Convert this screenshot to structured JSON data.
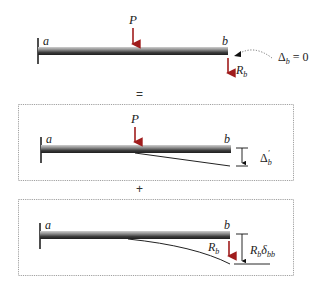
{
  "figure": {
    "colors": {
      "load_arrow": "#a01c1c",
      "beam_dark": "#2a2a2a",
      "beam_light": "#9a9a9a",
      "frame": "#888888",
      "text": "#222222"
    }
  },
  "panel_original": {
    "support_label": "a",
    "end_label": "b",
    "load_label": "P",
    "reaction_label": "R",
    "reaction_sub": "b",
    "condition_prefix": "Δ",
    "condition_sub": "b",
    "condition_suffix": " = 0"
  },
  "operator_equals": "=",
  "panel_load_only": {
    "support_label": "a",
    "end_label": "b",
    "load_label": "P",
    "deflection_label": "Δ",
    "deflection_sub": "b",
    "deflection_prime": "′"
  },
  "operator_plus": "+",
  "panel_reaction_only": {
    "support_label": "a",
    "end_label": "b",
    "reaction_label": "R",
    "reaction_sub": "b",
    "deflection_label_R": "R",
    "deflection_label_R_sub": "b",
    "deflection_label_delta": "δ",
    "deflection_label_delta_sub": "bb"
  }
}
